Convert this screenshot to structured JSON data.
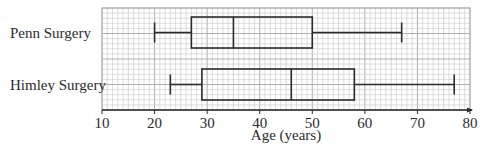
{
  "chart_data": {
    "type": "boxplot",
    "title": "",
    "xlabel": "Age (years)",
    "ylabel": "",
    "xlim": [
      10,
      80
    ],
    "x_ticks": [
      10,
      20,
      30,
      40,
      50,
      60,
      70,
      80
    ],
    "x_tick_labels": [
      "10",
      "20",
      "30",
      "40",
      "50",
      "60",
      "70",
      "80"
    ],
    "grid": true,
    "grid_minor_step": 2,
    "series": [
      {
        "name": "Penn Surgery",
        "min": 20,
        "q1": 27,
        "median": 35,
        "q3": 50,
        "max": 67
      },
      {
        "name": "Himley Surgery",
        "min": 23,
        "q1": 29,
        "median": 46,
        "q3": 58,
        "max": 77
      }
    ]
  },
  "colors": {
    "grid_minor": "#c8c8c8",
    "grid_major": "#a8a8a8",
    "box_stroke": "#2b2b2b",
    "text": "#2b2b2b"
  }
}
